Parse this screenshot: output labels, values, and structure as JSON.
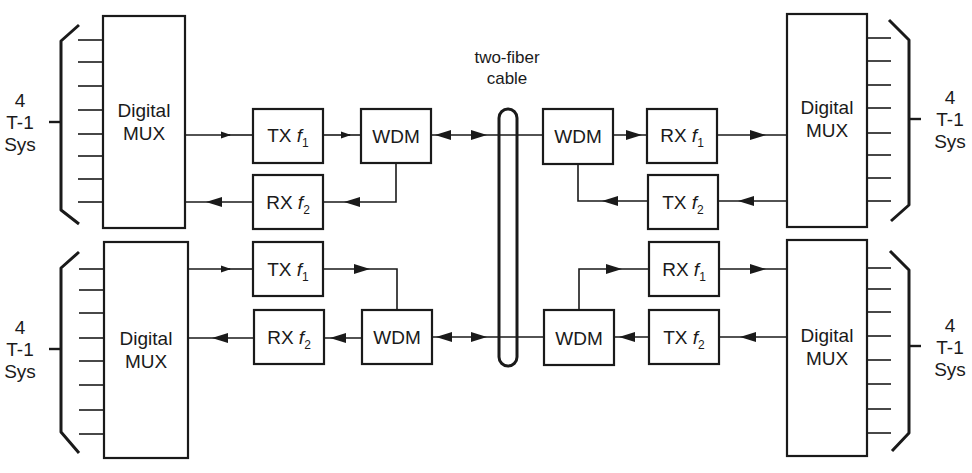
{
  "diagram": {
    "cable_label_line1": "two-fiber",
    "cable_label_line2": "cable",
    "left": {
      "top": {
        "sys_line1": "4",
        "sys_line2": "T-1",
        "sys_line3": "Sys",
        "mux_line1": "Digital",
        "mux_line2": "MUX",
        "tx": {
          "prefix": "TX",
          "freq": "f",
          "sub": "1"
        },
        "rx": {
          "prefix": "RX",
          "freq": "f",
          "sub": "2"
        },
        "wdm": "WDM"
      },
      "bottom": {
        "sys_line1": "4",
        "sys_line2": "T-1",
        "sys_line3": "Sys",
        "mux_line1": "Digital",
        "mux_line2": "MUX",
        "tx": {
          "prefix": "TX",
          "freq": "f",
          "sub": "1"
        },
        "rx": {
          "prefix": "RX",
          "freq": "f",
          "sub": "2"
        },
        "wdm": "WDM"
      }
    },
    "right": {
      "top": {
        "sys_line1": "4",
        "sys_line2": "T-1",
        "sys_line3": "Sys",
        "mux_line1": "Digital",
        "mux_line2": "MUX",
        "rx": {
          "prefix": "RX",
          "freq": "f",
          "sub": "1"
        },
        "tx": {
          "prefix": "TX",
          "freq": "f",
          "sub": "2"
        },
        "wdm": "WDM"
      },
      "bottom": {
        "sys_line1": "4",
        "sys_line2": "T-1",
        "sys_line3": "Sys",
        "mux_line1": "Digital",
        "mux_line2": "MUX",
        "rx": {
          "prefix": "RX",
          "freq": "f",
          "sub": "1"
        },
        "tx": {
          "prefix": "TX",
          "freq": "f",
          "sub": "2"
        },
        "wdm": "WDM"
      }
    },
    "colors": {
      "ink": "#1a1a1a",
      "background": "#ffffff"
    }
  }
}
